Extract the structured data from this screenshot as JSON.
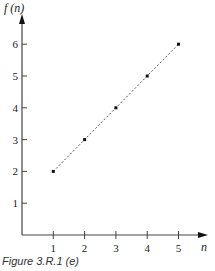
{
  "caption": "Figure 3.R.1 (e)",
  "chart_data": {
    "type": "scatter",
    "title": "",
    "xlabel": "n",
    "ylabel": "f (n)",
    "x": [
      1,
      2,
      3,
      4,
      5
    ],
    "series": [
      {
        "name": "f(n)",
        "values": [
          2,
          3,
          4,
          5,
          6
        ],
        "style": "points joined by dotted line"
      }
    ],
    "xticks": [
      1,
      2,
      3,
      4,
      5
    ],
    "yticks": [
      1,
      2,
      3,
      4,
      5,
      6
    ],
    "xlim": [
      0,
      5.8
    ],
    "ylim": [
      0,
      6.6
    ],
    "grid": false,
    "legend": "none"
  },
  "axes": {
    "x_label": "n",
    "y_label": "f (n)",
    "x_tick_labels": [
      "1",
      "2",
      "3",
      "4",
      "5"
    ],
    "y_tick_labels": [
      "1",
      "2",
      "3",
      "4",
      "5",
      "6"
    ]
  },
  "colors": {
    "axis": "#444444",
    "points": "#111111",
    "line": "#555555"
  }
}
